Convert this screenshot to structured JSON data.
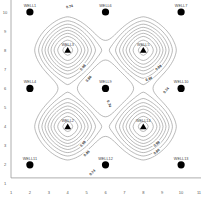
{
  "chart_data": {
    "type": "contour",
    "title": "",
    "xlabel": "",
    "ylabel": "",
    "xlim": [
      1,
      11
    ],
    "ylim": [
      1,
      10
    ],
    "x_ticks": [
      "1",
      "2",
      "3",
      "4",
      "5",
      "6",
      "7",
      "8",
      "9",
      "10",
      "11"
    ],
    "y_ticks": [
      "1",
      "2",
      "3",
      "4",
      "5",
      "6",
      "7",
      "8",
      "9",
      "10"
    ],
    "grid": false,
    "contour_labels": [
      "0.74",
      "0.86",
      "0.98"
    ],
    "contour_levels": [
      0.74,
      0.86,
      0.98
    ],
    "peaks": [
      {
        "name": "WELL3",
        "x": 4,
        "y": 8,
        "marker": "triangle"
      },
      {
        "name": "WELL5",
        "x": 8,
        "y": 8,
        "marker": "triangle"
      },
      {
        "name": "WELL2",
        "x": 4,
        "y": 4,
        "marker": "triangle"
      },
      {
        "name": "WELL14",
        "x": 8,
        "y": 4,
        "marker": "triangle"
      }
    ],
    "wells": [
      {
        "name": "WELL1",
        "x": 2,
        "y": 10,
        "marker": "circle"
      },
      {
        "name": "WELL6",
        "x": 6,
        "y": 10,
        "marker": "circle"
      },
      {
        "name": "WELL7",
        "x": 10,
        "y": 10,
        "marker": "circle"
      },
      {
        "name": "WELL4",
        "x": 2,
        "y": 6,
        "marker": "circle"
      },
      {
        "name": "WELL9",
        "x": 6,
        "y": 6,
        "marker": "circle"
      },
      {
        "name": "WELL10",
        "x": 10,
        "y": 6,
        "marker": "circle"
      },
      {
        "name": "WELL11",
        "x": 2,
        "y": 2,
        "marker": "circle"
      },
      {
        "name": "WELL12",
        "x": 6,
        "y": 2,
        "marker": "circle"
      },
      {
        "name": "WELL13",
        "x": 10,
        "y": 2,
        "marker": "circle"
      }
    ],
    "label_placements": [
      {
        "text": "0.74",
        "x": 4.1,
        "y": 10.3,
        "angle": -15
      },
      {
        "text": "0.98",
        "x": 4.8,
        "y": 7.1,
        "angle": -50
      },
      {
        "text": "0.86",
        "x": 5.1,
        "y": 6.5,
        "angle": -50
      },
      {
        "text": "0.98",
        "x": 8.8,
        "y": 7.1,
        "angle": -40
      },
      {
        "text": "0.86",
        "x": 8.3,
        "y": 6.5,
        "angle": -20
      },
      {
        "text": "0.74",
        "x": 9.2,
        "y": 5.9,
        "angle": -50
      },
      {
        "text": "0.74",
        "x": 6.2,
        "y": 5.2,
        "angle": 70
      },
      {
        "text": "0.98",
        "x": 4.8,
        "y": 3.1,
        "angle": -50
      },
      {
        "text": "0.86",
        "x": 5.0,
        "y": 2.6,
        "angle": -45
      },
      {
        "text": "0.74",
        "x": 5.3,
        "y": 1.6,
        "angle": -45
      },
      {
        "text": "0.98",
        "x": 8.7,
        "y": 3.1,
        "angle": -40
      },
      {
        "text": "0.86",
        "x": 8.7,
        "y": 2.7,
        "angle": -40
      }
    ]
  },
  "colors": {
    "contour": "#8a8a8a",
    "marker": "#000000",
    "axis": "#9a9a9a",
    "text": "#555555"
  }
}
